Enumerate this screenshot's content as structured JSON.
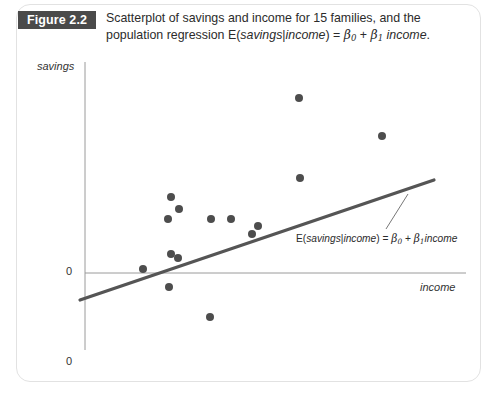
{
  "figure": {
    "badge_label": "Figure 2.2",
    "caption_line1_a": "Scatterplot of savings and income for 15 families, and the",
    "caption_line2_a": "population regression E(",
    "caption_savings": "savings",
    "caption_bar": "|",
    "caption_income": "income",
    "caption_eq": ") = ",
    "caption_beta": "β",
    "caption_sub0": "0",
    "caption_plus": " + ",
    "caption_sub1": "1",
    "caption_income2": " income",
    "caption_period": "."
  },
  "axes": {
    "y_label": "savings",
    "x_label": "income",
    "y_zero": "0",
    "x_zero": "0"
  },
  "annotation": {
    "prefix": "E(",
    "savings": "savings",
    "bar": "|",
    "income": "income",
    "eq": ") = ",
    "beta": "β",
    "sub0": "0",
    "plus": " + ",
    "sub1": "1",
    "income2": "income"
  },
  "colors": {
    "badge_bg": "#4a4a4a",
    "badge_text": "#ffffff",
    "point": "#4d4d4d",
    "regression_line": "#555555",
    "axis": "#9a9a9a",
    "frame": "#e2e2e2",
    "text": "#2b2b2b"
  },
  "chart_data": {
    "type": "scatter",
    "title": "Scatterplot of savings and income for 15 families, and the population regression E(savings|income) = β0 + β1 income",
    "xlabel": "income",
    "ylabel": "savings",
    "grid": false,
    "legend": "none",
    "n_points": 15,
    "axis_origin_px": {
      "x": 85,
      "y": 273
    },
    "xlim_px": [
      85,
      466
    ],
    "ylim_px": [
      62,
      350
    ],
    "points_px": [
      {
        "x": 143,
        "y": 269
      },
      {
        "x": 168,
        "y": 219
      },
      {
        "x": 171,
        "y": 197
      },
      {
        "x": 179,
        "y": 209
      },
      {
        "x": 171,
        "y": 254
      },
      {
        "x": 178,
        "y": 258
      },
      {
        "x": 169,
        "y": 287
      },
      {
        "x": 210,
        "y": 317
      },
      {
        "x": 211,
        "y": 219
      },
      {
        "x": 231,
        "y": 219
      },
      {
        "x": 252,
        "y": 234
      },
      {
        "x": 258,
        "y": 226
      },
      {
        "x": 299,
        "y": 98
      },
      {
        "x": 300,
        "y": 178
      },
      {
        "x": 382,
        "y": 136
      }
    ],
    "regression_line_px": {
      "x1": 80,
      "y1": 300,
      "x2": 434,
      "y2": 180
    },
    "leader_line_px": {
      "x1": 408,
      "y1": 194,
      "x2": 386,
      "y2": 229
    },
    "point_radius_px": 4.0,
    "x_axis_px": {
      "x1": 85,
      "y1": 273,
      "x2": 466,
      "y2": 273
    },
    "y_axis_px": {
      "x1": 85,
      "y1": 62,
      "x2": 85,
      "y2": 350
    }
  }
}
